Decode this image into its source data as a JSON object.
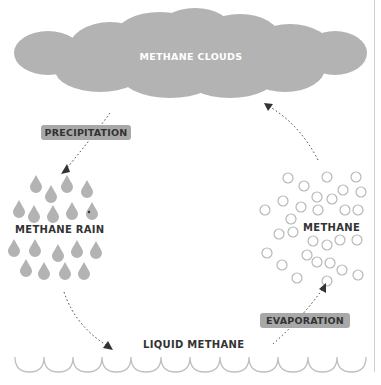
{
  "diagram": {
    "nodes": {
      "clouds": "METHANE CLOUDS",
      "rain": "METHANE RAIN",
      "gas": "METHANE",
      "liquid": "LIQUID METHANE"
    },
    "processes": {
      "precipitation": "PRECIPITATION",
      "evaporation": "EVAPORATION"
    },
    "colors": {
      "cloud": "#b3b3b3",
      "drop": "#b3b3b3",
      "tag": "#a8a8a8",
      "bubble_stroke": "#b8b8b8",
      "wave_stroke": "#c0c0c0",
      "arrow": "#333333"
    },
    "edges": [
      {
        "from": "clouds",
        "to": "rain",
        "label": "PRECIPITATION"
      },
      {
        "from": "rain",
        "to": "liquid",
        "label": ""
      },
      {
        "from": "liquid",
        "to": "gas",
        "label": "EVAPORATION"
      },
      {
        "from": "gas",
        "to": "clouds",
        "label": ""
      }
    ]
  }
}
